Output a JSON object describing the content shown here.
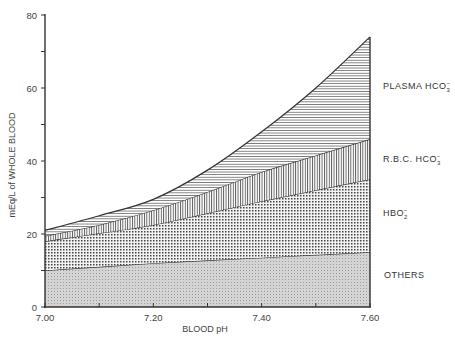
{
  "chart_data": {
    "type": "area",
    "stacked": true,
    "title": "",
    "xlabel": "BLOOD  pH",
    "ylabel": "mEq/L of WHOLE BLOOD",
    "x": [
      7.0,
      7.1,
      7.2,
      7.3,
      7.4,
      7.5,
      7.6
    ],
    "xticks": [
      "7.00",
      "7.20",
      "7.40",
      "7.60"
    ],
    "yticks": [
      "0",
      "20",
      "40",
      "60",
      "80"
    ],
    "xlim": [
      7.0,
      7.6
    ],
    "ylim": [
      0,
      80
    ],
    "grid": false,
    "series": [
      {
        "name": "OTHERS",
        "pattern": "fine-dots",
        "cumulative_top": [
          10,
          11,
          12,
          12.8,
          13.5,
          14.3,
          15
        ]
      },
      {
        "name": "HBO2-",
        "pattern": "coarse-dots",
        "cumulative_top": [
          18,
          20.2,
          22.5,
          25.7,
          29,
          32,
          35
        ]
      },
      {
        "name": "R.B.C. HCO3-",
        "pattern": "vertical-lines",
        "cumulative_top": [
          19.5,
          22.5,
          26.5,
          31.5,
          37,
          41.5,
          46
        ]
      },
      {
        "name": "PLASMA HCO3-",
        "pattern": "horizontal-lines",
        "cumulative_top": [
          21,
          25,
          29.5,
          37.5,
          48,
          60,
          74
        ]
      }
    ],
    "legend_position": "right (inline labels)"
  },
  "labels": {
    "plasma": "PLASMA  HCO",
    "plasma_sub": "3",
    "rbc": "R.B.C.  HCO",
    "rbc_sub": "3",
    "hbo2": "HBO",
    "hbo2_sub": "2",
    "others": "OTHERS",
    "minus": "−"
  }
}
